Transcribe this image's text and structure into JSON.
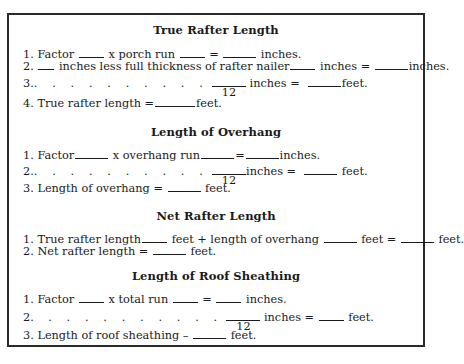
{
  "sections": [
    {
      "title": "True Rafter Length",
      "lines": [
        {
          "num": "1.",
          "parts": [
            "Factor",
            "x porch run",
            "=",
            "inches."
          ]
        },
        {
          "num": "2.",
          "parts": [
            "inches less full thickness of rafter nailer",
            "inches =",
            "inches."
          ]
        },
        {
          "num": "3.",
          "dots": ". . . . . . . . . .",
          "denominator": "12",
          "parts": [
            "inches  =",
            "feet."
          ]
        },
        {
          "num": "4.",
          "parts": [
            "True rafter length  =",
            "feet."
          ]
        }
      ]
    },
    {
      "title": "Length of Overhang",
      "lines": [
        {
          "num": "1.",
          "parts": [
            "Factor",
            "x overhang run",
            "=",
            "inches."
          ]
        },
        {
          "num": "2.",
          "dots": ". . . . . . . . . .",
          "denominator": "12",
          "parts": [
            "inches  =",
            "feet."
          ]
        },
        {
          "num": "3.",
          "parts": [
            "Length of overhang  =",
            "feet."
          ]
        }
      ]
    },
    {
      "title": "Net Rafter Length",
      "lines": [
        {
          "num": "1.",
          "parts": [
            "True rafter length",
            "feet + length of overhang",
            "feet =",
            "feet."
          ]
        },
        {
          "num": "2.",
          "parts": [
            "Net rafter length  =",
            "feet."
          ]
        }
      ]
    },
    {
      "title": "Length of Roof Sheathing",
      "lines": [
        {
          "num": "1.",
          "parts": [
            "Factor",
            "x total run",
            "=",
            "inches."
          ]
        },
        {
          "num": "2.",
          "dots": ". . . . . . . . . .",
          "denominator": "12",
          "parts": [
            "inches =",
            "feet."
          ]
        },
        {
          "num": "3.",
          "parts": [
            "Length of roof sheathing –",
            "feet."
          ]
        }
      ]
    }
  ]
}
